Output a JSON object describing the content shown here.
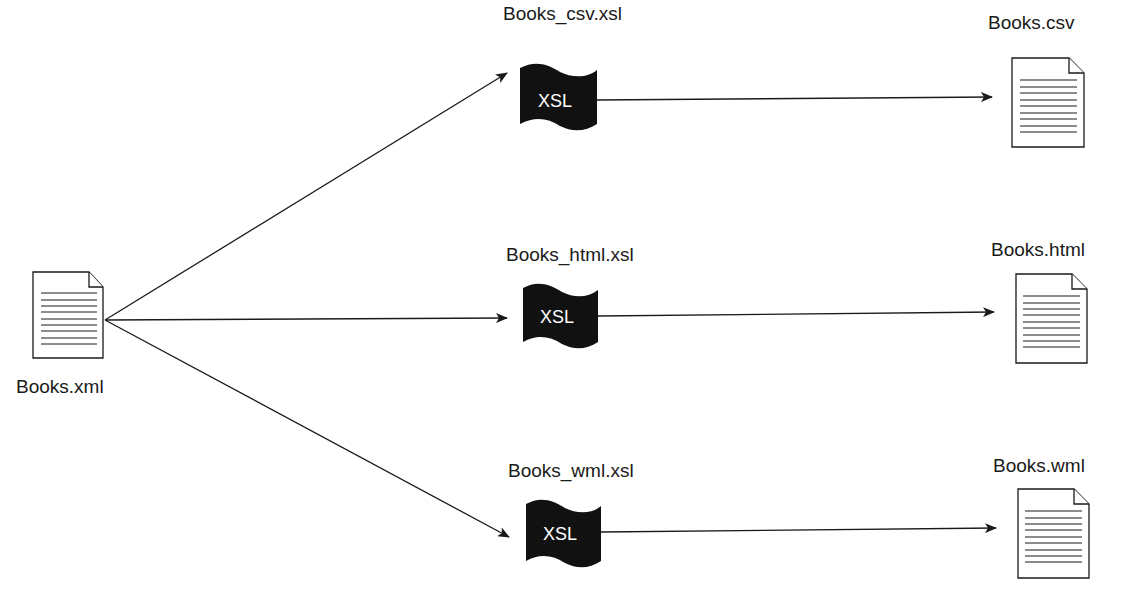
{
  "diagram": {
    "type": "xslt-transformation-flow",
    "colors": {
      "stroke": "#1a1a1a",
      "xsl_fill": "#111111",
      "background": "#ffffff",
      "xsl_text": "#ffffff"
    },
    "source": {
      "label": "Books.xml",
      "icon": "document-icon"
    },
    "transforms": [
      {
        "stylesheet_label": "Books_csv.xsl",
        "badge": "XSL",
        "icon": "xsl-stylesheet-icon",
        "output_label": "Books.csv",
        "output_icon": "document-icon"
      },
      {
        "stylesheet_label": "Books_html.xsl",
        "badge": "XSL",
        "icon": "xsl-stylesheet-icon",
        "output_label": "Books.html",
        "output_icon": "document-icon"
      },
      {
        "stylesheet_label": "Books_wml.xsl",
        "badge": "XSL",
        "icon": "xsl-stylesheet-icon",
        "output_label": "Books.wml",
        "output_icon": "document-icon"
      }
    ]
  }
}
